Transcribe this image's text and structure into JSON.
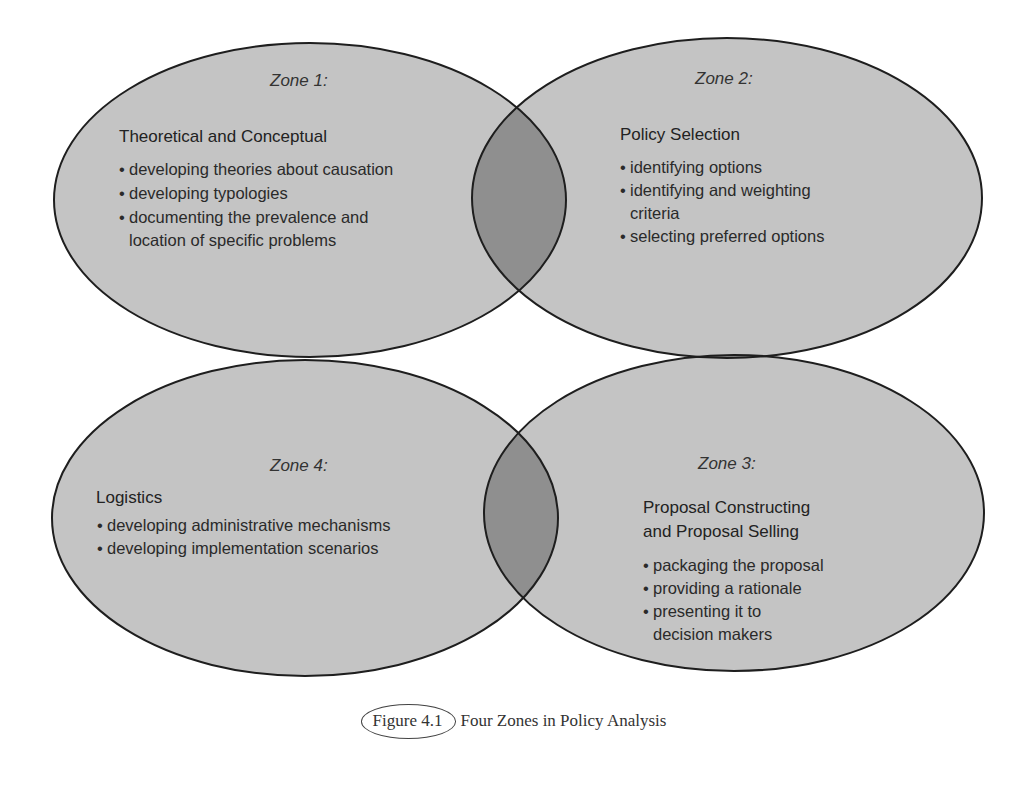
{
  "zones": [
    {
      "label": "Zone 1:",
      "title_lines": [
        "Theoretical and Conceptual"
      ],
      "items": [
        "developing theories about causation",
        "developing typologies",
        "documenting the prevalence and",
        "location of specific problems"
      ]
    },
    {
      "label": "Zone 2:",
      "title_lines": [
        "Policy Selection"
      ],
      "items": [
        "identifying options",
        "identifying and weighting",
        "criteria",
        "selecting preferred options"
      ]
    },
    {
      "label": "Zone 3:",
      "title_lines": [
        "Proposal Constructing",
        "and Proposal Selling"
      ],
      "items": [
        "packaging the proposal",
        "providing a rationale",
        "presenting it to",
        "decision makers"
      ]
    },
    {
      "label": "Zone 4:",
      "title_lines": [
        "Logistics"
      ],
      "items": [
        "developing administrative mechanisms",
        "developing implementation scenarios"
      ]
    }
  ],
  "caption": {
    "number": "Figure 4.1",
    "title": "Four Zones in Policy Analysis"
  },
  "colors": {
    "zone_fill": "#c4c4c4",
    "overlap_fill": "#8f8f8f",
    "outline": "#1e1e1e"
  }
}
